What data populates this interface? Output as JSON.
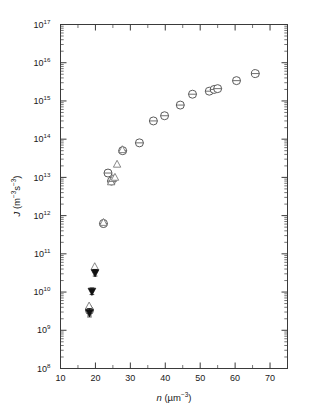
{
  "chart_data": {
    "type": "scatter",
    "title": "",
    "xlabel": "n (µm⁻³)",
    "ylabel": "J (m⁻³s⁻³)",
    "xlabel_parts": {
      "symbol": "n",
      "units": "(µm",
      "units_exp": "−3",
      "units_close": ")"
    },
    "ylabel_parts": {
      "symbol": "J",
      "units_open": "(m",
      "exp1": "−3",
      "mid": "s",
      "exp2": "−3",
      "units_close": ")"
    },
    "xscale": "linear",
    "yscale": "log",
    "xlim": [
      10,
      75
    ],
    "ylim": [
      100000000.0,
      1e+17
    ],
    "grid": false,
    "legend": "none",
    "x_ticks": [
      10,
      20,
      30,
      40,
      50,
      60,
      70
    ],
    "x_tick_labels": [
      "10",
      "20",
      "30",
      "40",
      "50",
      "60",
      "70"
    ],
    "x_minor_ticks": [
      15,
      25,
      35,
      45,
      55,
      65,
      75
    ],
    "y_ticks": [
      100000000.0,
      1000000000.0,
      10000000000.0,
      100000000000.0,
      1000000000000.0,
      10000000000000.0,
      100000000000000.0,
      1000000000000000.0,
      1e+16,
      1e+17
    ],
    "y_tick_labels": [
      "10",
      "10",
      "10",
      "10",
      "10",
      "10",
      "10",
      "10",
      "10",
      "10"
    ],
    "y_tick_exponents": [
      "8",
      "9",
      "10",
      "11",
      "12",
      "13",
      "14",
      "15",
      "16",
      "17"
    ],
    "series": [
      {
        "name": "open-circle",
        "marker": "circle-open",
        "has_error_bars": true,
        "points": [
          {
            "x": 18.3,
            "y": 3300000000.0,
            "yerr_frac": 0.3
          },
          {
            "x": 22.3,
            "y": 620000000000.0,
            "yerr_frac": 0.22
          },
          {
            "x": 24.6,
            "y": 8000000000000.0,
            "yerr_frac": 0.22
          },
          {
            "x": 23.6,
            "y": 13000000000000.0,
            "yerr_frac": 0.22
          },
          {
            "x": 27.8,
            "y": 50000000000000.0,
            "yerr_frac": 0.2
          },
          {
            "x": 32.6,
            "y": 80000000000000.0,
            "yerr_frac": 0.18
          },
          {
            "x": 36.6,
            "y": 300000000000000.0,
            "yerr_frac": 0.18
          },
          {
            "x": 39.8,
            "y": 410000000000000.0,
            "yerr_frac": 0.18
          },
          {
            "x": 44.3,
            "y": 780000000000000.0,
            "yerr_frac": 0.18
          },
          {
            "x": 47.8,
            "y": 1500000000000000.0,
            "yerr_frac": 0.16
          },
          {
            "x": 52.6,
            "y": 1800000000000000.0,
            "yerr_frac": 0.16
          },
          {
            "x": 54.0,
            "y": 2000000000000000.0,
            "yerr_frac": 0.16
          },
          {
            "x": 55.0,
            "y": 2100000000000000.0,
            "yerr_frac": 0.16
          },
          {
            "x": 60.4,
            "y": 3400000000000000.0,
            "yerr_frac": 0.16
          },
          {
            "x": 65.8,
            "y": 5200000000000000.0,
            "yerr_frac": 0.16
          }
        ]
      },
      {
        "name": "open-up-triangle",
        "marker": "triangle-up-open",
        "has_error_bars": false,
        "points": [
          {
            "x": 18.2,
            "y": 4300000000.0
          },
          {
            "x": 19.8,
            "y": 46000000000.0
          },
          {
            "x": 22.3,
            "y": 660000000000.0
          },
          {
            "x": 24.5,
            "y": 7600000000000.0
          },
          {
            "x": 25.0,
            "y": 9300000000000.0
          },
          {
            "x": 25.6,
            "y": 10000000000000.0
          },
          {
            "x": 26.2,
            "y": 22000000000000.0
          },
          {
            "x": 27.7,
            "y": 53000000000000.0
          }
        ]
      },
      {
        "name": "filled-down-triangle",
        "marker": "triangle-down-filled",
        "has_error_bars": true,
        "points": [
          {
            "x": 18.3,
            "y": 2900000000.0,
            "yerr_frac": 0.28
          },
          {
            "x": 19.0,
            "y": 10500000000.0,
            "yerr_frac": 0.22
          },
          {
            "x": 19.9,
            "y": 32000000000.0,
            "yerr_frac": 0.22
          }
        ]
      }
    ]
  },
  "figure": {
    "background": "#ffffff",
    "axis_color": "#3a3a3a",
    "marker_open_color": "#ffffff",
    "marker_stroke_color": "#4a4a4a",
    "marker_filled_color": "#111111"
  }
}
